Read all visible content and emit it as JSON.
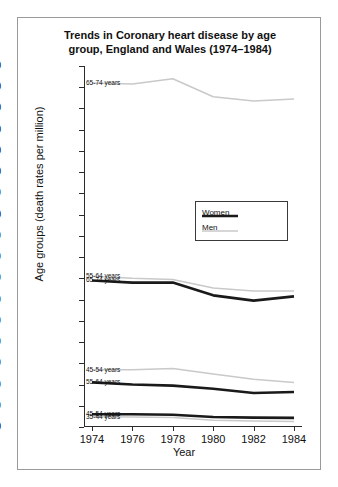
{
  "chart_data": {
    "type": "line",
    "title": "Trends in Coronary heart disease by age group, England and Wales (1974–1984)",
    "title_line1": "Trends in Coronary heart disease by age",
    "title_line2": "group, England and Wales (1974–1984)",
    "xlabel": "Year",
    "ylabel": "Age groups (death rates per million)",
    "x": [
      1974,
      1976,
      1978,
      1980,
      1982,
      1984
    ],
    "xtick_labels": [
      "1974",
      "1976",
      "1978",
      "1980",
      "1982",
      "1984"
    ],
    "ytick_labels": [
      "17000",
      "16000",
      "15000",
      "14000",
      "13000",
      "12000",
      "11000",
      "10000",
      "9000",
      "8000",
      "7000",
      "6000",
      "5000",
      "4000",
      "3000",
      "2000",
      "1000",
      "0"
    ],
    "ytick_values": [
      17000,
      16000,
      15000,
      14000,
      13000,
      12000,
      11000,
      10000,
      9000,
      8000,
      7000,
      6000,
      5000,
      4000,
      3000,
      2000,
      1000,
      0
    ],
    "ylim": [
      0,
      17000
    ],
    "xlim": [
      1974,
      1984
    ],
    "grid": false,
    "legend_position": "center",
    "legend": [
      {
        "name": "Women",
        "color": "#1a1a1a",
        "width": 2.6
      },
      {
        "name": "Men",
        "color": "#c9c9c9",
        "width": 1.5
      }
    ],
    "series": [
      {
        "name": "Men 65-74",
        "group": "65-74 years",
        "sex": "Men",
        "color": "#c9c9c9",
        "values": [
          16200,
          16150,
          16400,
          15550,
          15350,
          15450
        ]
      },
      {
        "name": "Men 55-64",
        "group": "55-64 years",
        "sex": "Men",
        "color": "#c9c9c9",
        "values": [
          7100,
          7000,
          6950,
          6550,
          6400,
          6400
        ]
      },
      {
        "name": "Women 65-74",
        "group": "65-74 years",
        "sex": "Women",
        "color": "#1a1a1a",
        "values": [
          6900,
          6800,
          6800,
          6200,
          5950,
          6150
        ]
      },
      {
        "name": "Men 45-54",
        "group": "45-54 years",
        "sex": "Men",
        "color": "#c9c9c9",
        "values": [
          2700,
          2700,
          2750,
          2500,
          2250,
          2100
        ]
      },
      {
        "name": "Women 55-64",
        "group": "55-64 years",
        "sex": "Women",
        "color": "#1a1a1a",
        "values": [
          2100,
          2000,
          1950,
          1800,
          1600,
          1650
        ]
      },
      {
        "name": "Women 45-54",
        "group": "45-54 years",
        "sex": "Women",
        "color": "#1a1a1a",
        "values": [
          600,
          600,
          580,
          470,
          440,
          430
        ]
      },
      {
        "name": "Men 35-44",
        "group": "35-44 years",
        "sex": "Men",
        "color": "#c9c9c9",
        "values": [
          480,
          470,
          450,
          320,
          280,
          260
        ]
      }
    ],
    "annotations": [
      {
        "text": "65-74 years",
        "series": "Men 65-74"
      },
      {
        "text": "55-64 years",
        "series": "Men 55-64"
      },
      {
        "text": "65-74 years",
        "series": "Women 65-74"
      },
      {
        "text": "45-54 years",
        "series": "Men 45-54"
      },
      {
        "text": "55-64 years",
        "series": "Women 55-64"
      },
      {
        "text": "45-54 years",
        "series": "Women 45-54"
      },
      {
        "text": "35-44 years",
        "series": "Men 35-44"
      }
    ]
  }
}
